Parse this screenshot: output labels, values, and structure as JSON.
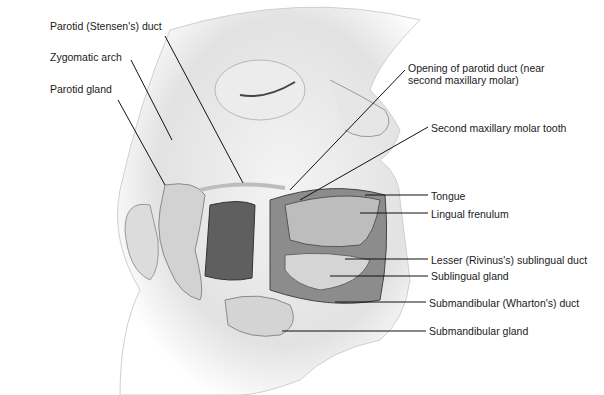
{
  "figure": {
    "colors": {
      "background": "#ffffff",
      "line": "#111111",
      "skin": "#e8e8e8",
      "tissue_dark": "#6e6e6e",
      "gland": "#cfcfcf"
    }
  },
  "labels": [
    {
      "id": "parotid-duct",
      "text": "Parotid (Stensen's) duct",
      "x": 50,
      "y": 20
    },
    {
      "id": "zygomatic-arch",
      "text": "Zygomatic arch",
      "x": 50,
      "y": 51
    },
    {
      "id": "parotid-gland",
      "text": "Parotid gland",
      "x": 50,
      "y": 83
    },
    {
      "id": "opening-parotid-duct",
      "text": "Opening of parotid duct (near",
      "text2": "second maxillary molar)",
      "x": 408,
      "y": 62
    },
    {
      "id": "second-molar",
      "text": "Second maxillary molar tooth",
      "x": 431,
      "y": 122
    },
    {
      "id": "tongue",
      "text": "Tongue",
      "x": 431,
      "y": 190
    },
    {
      "id": "lingual-frenulum",
      "text": "Lingual frenulum",
      "x": 431,
      "y": 210
    },
    {
      "id": "lesser-sublingual-duct",
      "text": "Lesser (Rivinus's) sublingual duct",
      "x": 431,
      "y": 254
    },
    {
      "id": "sublingual-gland",
      "text": "Sublingual gland",
      "x": 431,
      "y": 272
    },
    {
      "id": "submandibular-duct",
      "text": "Submandibular (Wharton's) duct",
      "x": 429,
      "y": 298
    },
    {
      "id": "submandibular-gland",
      "text": "Submandibular gland",
      "x": 429,
      "y": 326
    }
  ]
}
